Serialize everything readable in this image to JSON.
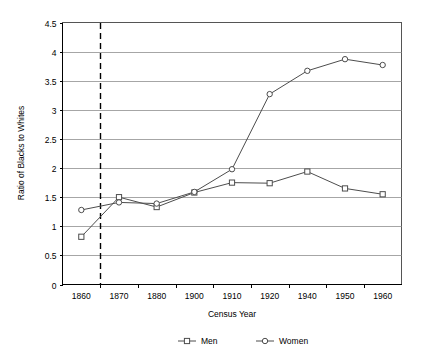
{
  "chart_data": {
    "type": "line",
    "title": "",
    "xlabel": "Census Year",
    "ylabel": "Ratio of Blacks to Whites",
    "categories": [
      "1860",
      "1870",
      "1880",
      "1900",
      "1910",
      "1920",
      "1940",
      "1950",
      "1960"
    ],
    "ylim": [
      0,
      4.5
    ],
    "ytick_labels": [
      "0",
      "0.5",
      "1",
      "1.5",
      "2",
      "2.5",
      "3",
      "3.5",
      "4",
      "4.5"
    ],
    "ytick_values": [
      0,
      0.5,
      1,
      1.5,
      2,
      2.5,
      3,
      3.5,
      4,
      4.5
    ],
    "grid": "horizontal",
    "legend_position": "bottom",
    "series": [
      {
        "name": "Men",
        "marker": "square",
        "values": [
          0.82,
          1.5,
          1.33,
          1.58,
          1.75,
          1.74,
          1.94,
          1.65,
          1.55
        ]
      },
      {
        "name": "Women",
        "marker": "circle",
        "values": [
          1.28,
          1.41,
          1.39,
          1.59,
          1.98,
          3.27,
          3.67,
          3.87,
          3.77
        ]
      }
    ],
    "annotations": [
      {
        "type": "vertical-dashed-line",
        "x_position_between": [
          "1860",
          "1870"
        ],
        "x_value": 1865,
        "label": ""
      }
    ]
  },
  "colors": {
    "series_line": "#4d4d4d",
    "gridline": "#808080",
    "axis": "#000000",
    "plot_background": "#ffffff",
    "page_background": "#ffffff"
  }
}
